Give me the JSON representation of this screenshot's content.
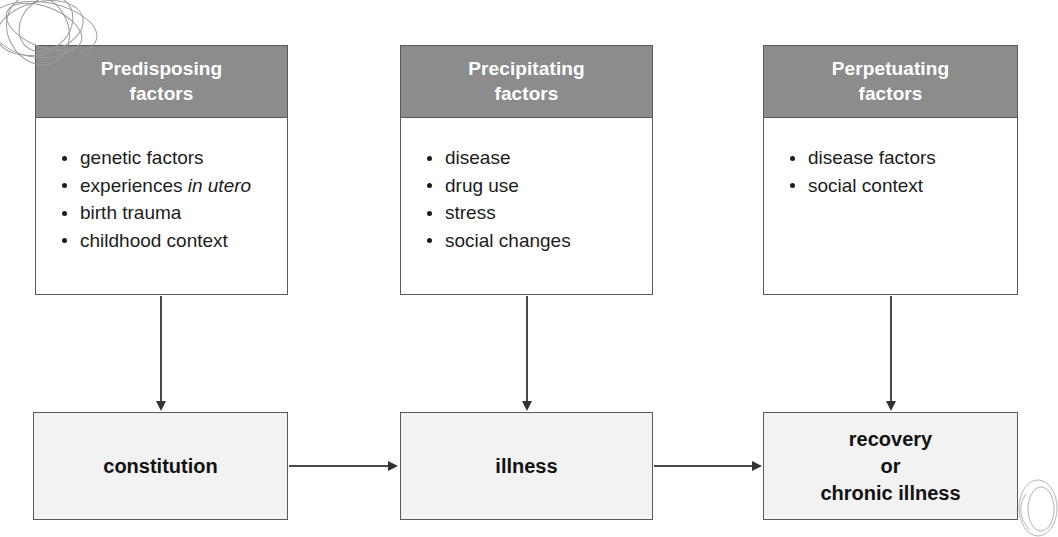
{
  "diagram": {
    "colors": {
      "header_gray": "#8c8c8c",
      "header_text": "#ffffff",
      "outcome_fill": "#f2f2f2",
      "border": "#59595c",
      "arrow": "#333333",
      "body_text": "#1c1c1c"
    },
    "factor_boxes": [
      {
        "id": "predisposing",
        "header_line1": "Predisposing",
        "header_line2": "factors",
        "items": [
          {
            "text": "genetic factors",
            "italic": ""
          },
          {
            "text": "experiences ",
            "italic": "in utero"
          },
          {
            "text": "birth trauma",
            "italic": ""
          },
          {
            "text": "childhood context",
            "italic": ""
          }
        ]
      },
      {
        "id": "precipitating",
        "header_line1": "Precipitating",
        "header_line2": "factors",
        "items": [
          {
            "text": "disease",
            "italic": ""
          },
          {
            "text": "drug use",
            "italic": ""
          },
          {
            "text": "stress",
            "italic": ""
          },
          {
            "text": "social changes",
            "italic": ""
          }
        ]
      },
      {
        "id": "perpetuating",
        "header_line1": "Perpetuating",
        "header_line2": "factors",
        "items": [
          {
            "text": "disease factors",
            "italic": ""
          },
          {
            "text": "social context",
            "italic": ""
          }
        ]
      }
    ],
    "outcome_boxes": [
      {
        "id": "constitution",
        "line1": "constitution",
        "line2": "",
        "line3": ""
      },
      {
        "id": "illness",
        "line1": "illness",
        "line2": "",
        "line3": ""
      },
      {
        "id": "recovery",
        "line1": "recovery",
        "line2": "or",
        "line3": "chronic illness"
      }
    ],
    "connectors": {
      "vertical_count": 3,
      "horizontal_count": 2,
      "direction": "downward-and-rightward"
    },
    "artifacts": [
      {
        "id": "scribble-top-left",
        "kind": "scan-scribble"
      },
      {
        "id": "oval-bottom-right",
        "kind": "scan-oval"
      }
    ]
  }
}
